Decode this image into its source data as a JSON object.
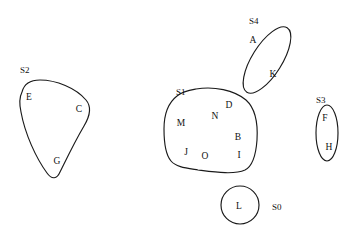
{
  "diagram": {
    "background_color": "#ffffff",
    "stroke_color": "#1a1a1a",
    "text_color": "#111111",
    "width": 352,
    "height": 237,
    "regions": [
      {
        "id": "S2",
        "label": "S2",
        "label_x": 20,
        "label_y": 73,
        "shape": "rounded-triangle",
        "path": "M 22 92 C 24 84 30 80 40 80 C 56 80 76 88 86 100 C 92 107 90 116 84 126 C 74 143 66 160 60 172 C 57 179 52 180 47 173 C 36 158 25 134 21 112 C 19 103 20 96 22 92 Z",
        "members": [
          {
            "label": "E",
            "x": 29,
            "y": 100
          },
          {
            "label": "C",
            "x": 79,
            "y": 112
          },
          {
            "label": "G",
            "x": 57,
            "y": 164
          }
        ]
      },
      {
        "id": "S1",
        "label": "S1",
        "label_x": 176,
        "label_y": 95,
        "shape": "irregular-blob",
        "path": "M 196 89 C 214 86 234 90 246 100 C 256 109 258 124 257 140 C 256 154 253 166 245 170 C 234 175 214 172 198 170 C 186 168 176 167 171 161 C 165 154 164 142 164 129 C 164 116 168 103 177 96 C 183 91 190 90 196 89 Z",
        "members": [
          {
            "label": "M",
            "x": 181,
            "y": 126
          },
          {
            "label": "N",
            "x": 215,
            "y": 119
          },
          {
            "label": "D",
            "x": 229,
            "y": 108
          },
          {
            "label": "B",
            "x": 238,
            "y": 140
          },
          {
            "label": "J",
            "x": 186,
            "y": 155
          },
          {
            "label": "O",
            "x": 205,
            "y": 159
          },
          {
            "label": "I",
            "x": 239,
            "y": 158
          }
        ]
      },
      {
        "id": "S4",
        "label": "S4",
        "label_x": 249,
        "label_y": 24,
        "shape": "tilted-ellipse",
        "ellipse": {
          "cx": 267,
          "cy": 60,
          "rx": 15,
          "ry": 38,
          "rotation": 32
        },
        "members": [
          {
            "label": "A",
            "x": 253,
            "y": 43
          },
          {
            "label": "K",
            "x": 273,
            "y": 77
          }
        ]
      },
      {
        "id": "S3",
        "label": "S3",
        "label_x": 316,
        "label_y": 103,
        "shape": "vertical-ellipse",
        "ellipse": {
          "cx": 327,
          "cy": 133,
          "rx": 11,
          "ry": 28,
          "rotation": 0
        },
        "members": [
          {
            "label": "F",
            "x": 325,
            "y": 121
          },
          {
            "label": "H",
            "x": 329,
            "y": 150
          }
        ]
      },
      {
        "id": "S0",
        "label": "S0",
        "label_x": 272,
        "label_y": 210,
        "shape": "circle",
        "ellipse": {
          "cx": 240,
          "cy": 205,
          "rx": 19,
          "ry": 19,
          "rotation": 0
        },
        "members": [
          {
            "label": "L",
            "x": 239,
            "y": 209
          }
        ]
      }
    ]
  }
}
